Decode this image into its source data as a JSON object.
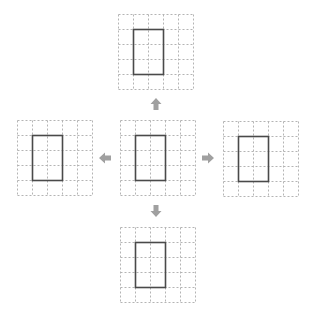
{
  "diagram": {
    "colors": {
      "grid_line": "#b4b4b4",
      "rectangle": "#4a4a4a",
      "arrow": "#a0a0a0",
      "background": "#ffffff"
    },
    "grid": {
      "rows": 5,
      "cols": 5,
      "cell_size": 15
    },
    "panels": [
      {
        "id": "top",
        "x": 118,
        "y": 14,
        "rect": {
          "col": 1,
          "row": 1,
          "cols": 2,
          "rows": 3
        }
      },
      {
        "id": "left",
        "x": 17,
        "y": 120,
        "rect": {
          "col": 1,
          "row": 1,
          "cols": 2,
          "rows": 3
        }
      },
      {
        "id": "center",
        "x": 120,
        "y": 120,
        "rect": {
          "col": 1,
          "row": 1,
          "cols": 2,
          "rows": 3
        }
      },
      {
        "id": "right",
        "x": 223,
        "y": 121,
        "rect": {
          "col": 1,
          "row": 1,
          "cols": 2,
          "rows": 3
        }
      },
      {
        "id": "bottom",
        "x": 120,
        "y": 227,
        "rect": {
          "col": 1,
          "row": 1,
          "cols": 2,
          "rows": 3
        }
      }
    ],
    "arrows": [
      {
        "id": "up",
        "direction": "up",
        "cx": 156,
        "cy": 104
      },
      {
        "id": "left",
        "direction": "left",
        "cx": 105,
        "cy": 158
      },
      {
        "id": "right",
        "direction": "right",
        "cx": 208,
        "cy": 158
      },
      {
        "id": "down",
        "direction": "down",
        "cx": 156,
        "cy": 211
      }
    ]
  }
}
